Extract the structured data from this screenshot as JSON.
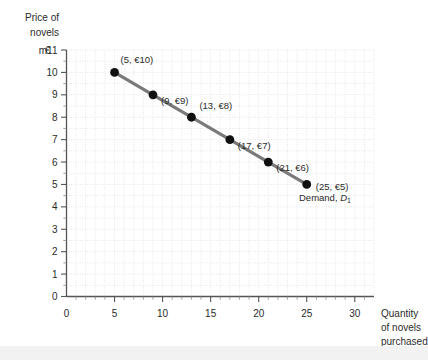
{
  "chart_data": {
    "type": "line",
    "title": "",
    "ylabel": "Price of novels €m",
    "ylabel_lines": [
      "Price of",
      "novels",
      "€m"
    ],
    "xlabel": "Quantity of novels purchased",
    "xlabel_lines": [
      "Quantity",
      "of novels",
      "purchased"
    ],
    "xlim": [
      0,
      32
    ],
    "ylim": [
      0,
      11
    ],
    "xticks": [
      0,
      5,
      10,
      15,
      20,
      25,
      30
    ],
    "xtick_labels": [
      "0",
      "5",
      "10",
      "15",
      "20",
      "25",
      "30"
    ],
    "yticks": [
      0,
      1,
      2,
      3,
      4,
      5,
      6,
      7,
      8,
      9,
      10,
      11
    ],
    "ytick_labels": [
      "0",
      "1",
      "2",
      "3",
      "4",
      "5",
      "6",
      "7",
      "8",
      "9",
      "10",
      "11"
    ],
    "ytick_top_prefix": "m",
    "grid": true,
    "grid_step_x": 1,
    "grid_step_y": 0.5,
    "legend_position": "inline-right",
    "series": [
      {
        "name": "Demand, D1",
        "label_text": "Demand, ",
        "label_italic": "D",
        "label_subscript": "1",
        "color": "#7a7a7a",
        "marker_color": "#111111",
        "x": [
          5,
          9,
          13,
          17,
          21,
          25
        ],
        "values": [
          10,
          9,
          8,
          7,
          6,
          5
        ],
        "point_labels": [
          "(5, €10)",
          "(9, €9)",
          "(13, €8)",
          "(17, €7)",
          "(21, €6)",
          "(25, €5)"
        ]
      }
    ]
  },
  "colors": {
    "line": "#7a7a7a",
    "marker": "#111111",
    "axis": "#555555",
    "grid": "#c9c9c9",
    "text": "#2b2b2b",
    "background": "#ffffff"
  }
}
